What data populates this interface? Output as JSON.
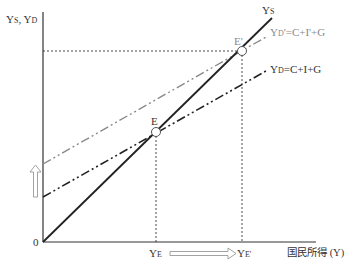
{
  "diagram": {
    "type": "keynesian-cross",
    "y_axis_label": {
      "main1": "Y",
      "sub1": "S",
      "sep": ", ",
      "main2": "Y",
      "sub2": "D"
    },
    "x_axis_label": "国民所得 (Y)",
    "origin_label": "0",
    "lines": {
      "ys": {
        "main": "Y",
        "sub": "S"
      },
      "yd_prime": {
        "main": "Y",
        "sub": "D",
        "rest": "'=C+I'+G"
      },
      "yd": {
        "main": "Y",
        "sub": "D",
        "rest": "=C+I+G"
      }
    },
    "points": {
      "e": "E",
      "e_prime": "E'"
    },
    "x_ticks": {
      "ye": {
        "main": "Y",
        "sub": "E"
      },
      "ye_prime": {
        "main": "Y",
        "sub": "E'"
      }
    },
    "colors": {
      "axis": "#333333",
      "ys_line": "#222222",
      "yd_line": "#222222",
      "yd_prime_line": "#8a8a8a",
      "arrow": "#999999"
    }
  }
}
